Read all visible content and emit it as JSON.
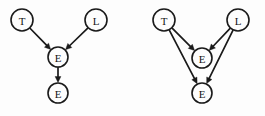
{
  "figure": {
    "title": "",
    "background_color": "#fdfdfd",
    "stroke_color": "#1a1a1a",
    "width": 265,
    "height": 116
  },
  "diagrams": [
    {
      "id": "left-diagram",
      "name": "causal-chain-graph",
      "nodes": [
        {
          "id": "T",
          "label": "T",
          "cx": 22,
          "cy": 20,
          "r": 11
        },
        {
          "id": "L",
          "label": "L",
          "cx": 96,
          "cy": 20,
          "r": 11
        },
        {
          "id": "E1",
          "label": "E",
          "cx": 58,
          "cy": 57,
          "r": 10
        },
        {
          "id": "E2",
          "label": "E",
          "cx": 58,
          "cy": 93,
          "r": 10
        }
      ],
      "edges": [
        {
          "from": "T",
          "to": "E1",
          "directed": true
        },
        {
          "from": "L",
          "to": "E1",
          "directed": true
        },
        {
          "from": "E1",
          "to": "E2",
          "directed": true
        }
      ]
    },
    {
      "id": "right-diagram",
      "name": "common-cause-graph",
      "nodes": [
        {
          "id": "T",
          "label": "T",
          "cx": 164,
          "cy": 20,
          "r": 11
        },
        {
          "id": "L",
          "label": "L",
          "cx": 238,
          "cy": 20,
          "r": 11
        },
        {
          "id": "E1",
          "label": "E",
          "cx": 202,
          "cy": 58,
          "r": 10
        },
        {
          "id": "E2",
          "label": "E",
          "cx": 202,
          "cy": 93,
          "r": 10
        }
      ],
      "edges": [
        {
          "from": "T",
          "to": "E1",
          "directed": true
        },
        {
          "from": "L",
          "to": "E1",
          "directed": true
        },
        {
          "from": "T",
          "to": "E2",
          "directed": true
        },
        {
          "from": "L",
          "to": "E2",
          "directed": true
        }
      ]
    }
  ]
}
